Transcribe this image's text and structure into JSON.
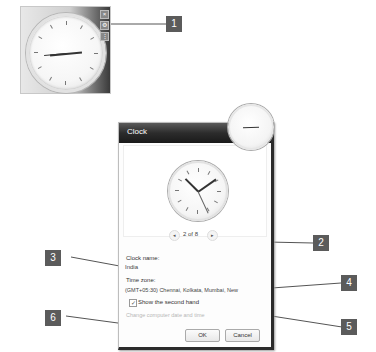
{
  "gadget": {
    "name": "Clock gadget",
    "controls": [
      "close",
      "options",
      "drag"
    ]
  },
  "dialog": {
    "title": "Clock",
    "pager": {
      "text": "2 of 8",
      "prev": "◂",
      "next": "▸"
    },
    "clock_name_label": "Clock name:",
    "clock_name_value": "India",
    "time_zone_label": "Time zone:",
    "time_zone_value": "(GMT+05:30) Chennai, Kolkata, Mumbai, New",
    "second_hand_label": "Show the second hand",
    "second_hand_checked": true,
    "change_time_link": "Change computer date and time",
    "ok_label": "OK",
    "cancel_label": "Cancel"
  },
  "callouts": [
    {
      "number": "1"
    },
    {
      "number": "2"
    },
    {
      "number": "3"
    },
    {
      "number": "4"
    },
    {
      "number": "5"
    },
    {
      "number": "6"
    }
  ],
  "colors": {
    "callout": "#5b5b5b",
    "titlebar": "#2c2c2c"
  }
}
